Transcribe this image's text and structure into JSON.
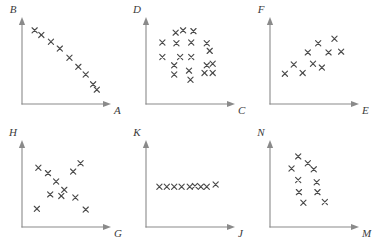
{
  "figure": {
    "title": "",
    "layout": {
      "rows": 2,
      "cols": 3,
      "panel_width": 124,
      "panel_height": 123
    },
    "style": {
      "axis_color": "#8a8a8a",
      "marker_color": "#4a4a4a",
      "label_color": "#3a3a3a",
      "background": "#ffffff",
      "marker_symbol": "x"
    }
  },
  "chart_data": [
    {
      "type": "scatter",
      "title": "",
      "xlabel": "A",
      "ylabel": "B",
      "xlim": [
        0,
        100
      ],
      "ylim": [
        0,
        100
      ],
      "grid": false,
      "legend": "none",
      "relationship": "strong negative linear correlation",
      "points": [
        {
          "x": 9,
          "y": 89
        },
        {
          "x": 18,
          "y": 83
        },
        {
          "x": 31,
          "y": 74
        },
        {
          "x": 43,
          "y": 65
        },
        {
          "x": 56,
          "y": 53
        },
        {
          "x": 68,
          "y": 41
        },
        {
          "x": 78,
          "y": 31
        },
        {
          "x": 88,
          "y": 18
        },
        {
          "x": 93,
          "y": 11
        }
      ]
    },
    {
      "type": "scatter",
      "title": "",
      "xlabel": "C",
      "ylabel": "D",
      "xlim": [
        0,
        100
      ],
      "ylim": [
        0,
        100
      ],
      "grid": false,
      "legend": "none",
      "relationship": "no correlation, random scatter",
      "points": [
        {
          "x": 32,
          "y": 86
        },
        {
          "x": 42,
          "y": 89
        },
        {
          "x": 56,
          "y": 88
        },
        {
          "x": 14,
          "y": 73
        },
        {
          "x": 33,
          "y": 72
        },
        {
          "x": 53,
          "y": 73
        },
        {
          "x": 74,
          "y": 72
        },
        {
          "x": 78,
          "y": 62
        },
        {
          "x": 14,
          "y": 54
        },
        {
          "x": 38,
          "y": 54
        },
        {
          "x": 53,
          "y": 54
        },
        {
          "x": 30,
          "y": 43
        },
        {
          "x": 74,
          "y": 43
        },
        {
          "x": 82,
          "y": 45
        },
        {
          "x": 50,
          "y": 36
        },
        {
          "x": 30,
          "y": 31
        },
        {
          "x": 71,
          "y": 33
        },
        {
          "x": 82,
          "y": 33
        },
        {
          "x": 52,
          "y": 24
        }
      ]
    },
    {
      "type": "scatter",
      "title": "",
      "xlabel": "E",
      "ylabel": "F",
      "xlim": [
        0,
        100
      ],
      "ylim": [
        0,
        100
      ],
      "grid": false,
      "legend": "none",
      "relationship": "positive correlation",
      "points": [
        {
          "x": 12,
          "y": 32
        },
        {
          "x": 24,
          "y": 44
        },
        {
          "x": 36,
          "y": 33
        },
        {
          "x": 43,
          "y": 60
        },
        {
          "x": 50,
          "y": 45
        },
        {
          "x": 57,
          "y": 72
        },
        {
          "x": 62,
          "y": 40
        },
        {
          "x": 71,
          "y": 60
        },
        {
          "x": 79,
          "y": 78
        },
        {
          "x": 88,
          "y": 61
        }
      ]
    },
    {
      "type": "scatter",
      "title": "",
      "xlabel": "G",
      "ylabel": "H",
      "xlim": [
        0,
        100
      ],
      "ylim": [
        0,
        100
      ],
      "grid": false,
      "legend": "none",
      "relationship": "weak negative correlation, wide scatter",
      "points": [
        {
          "x": 14,
          "y": 70
        },
        {
          "x": 27,
          "y": 63
        },
        {
          "x": 38,
          "y": 52
        },
        {
          "x": 30,
          "y": 35
        },
        {
          "x": 49,
          "y": 41
        },
        {
          "x": 45,
          "y": 33
        },
        {
          "x": 61,
          "y": 65
        },
        {
          "x": 71,
          "y": 76
        },
        {
          "x": 64,
          "y": 31
        },
        {
          "x": 12,
          "y": 16
        },
        {
          "x": 78,
          "y": 15
        }
      ]
    },
    {
      "type": "scatter",
      "title": "",
      "xlabel": "J",
      "ylabel": "K",
      "xlim": [
        0,
        100
      ],
      "ylim": [
        0,
        100
      ],
      "grid": false,
      "legend": "none",
      "relationship": "zero correlation, constant horizontal line",
      "points": [
        {
          "x": 10,
          "y": 45
        },
        {
          "x": 20,
          "y": 45
        },
        {
          "x": 30,
          "y": 45
        },
        {
          "x": 40,
          "y": 45
        },
        {
          "x": 51,
          "y": 45
        },
        {
          "x": 58,
          "y": 46
        },
        {
          "x": 66,
          "y": 45
        },
        {
          "x": 74,
          "y": 45
        },
        {
          "x": 86,
          "y": 48
        }
      ]
    },
    {
      "type": "scatter",
      "title": "",
      "xlabel": "M",
      "ylabel": "N",
      "xlim": [
        0,
        100
      ],
      "ylim": [
        0,
        100
      ],
      "grid": false,
      "legend": "none",
      "relationship": "negative correlation",
      "points": [
        {
          "x": 30,
          "y": 85
        },
        {
          "x": 43,
          "y": 76
        },
        {
          "x": 21,
          "y": 69
        },
        {
          "x": 51,
          "y": 68
        },
        {
          "x": 30,
          "y": 54
        },
        {
          "x": 55,
          "y": 51
        },
        {
          "x": 31,
          "y": 38
        },
        {
          "x": 56,
          "y": 38
        },
        {
          "x": 37,
          "y": 24
        },
        {
          "x": 66,
          "y": 25
        }
      ]
    }
  ]
}
